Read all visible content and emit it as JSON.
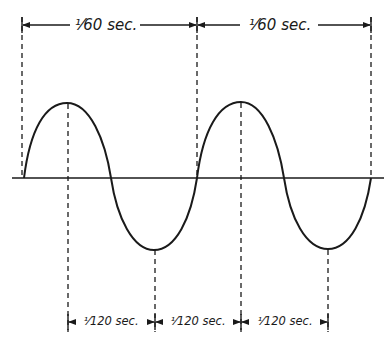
{
  "diagram": {
    "colors": {
      "ink": "#1a1a1a",
      "background": "#ffffff"
    },
    "top_labels": [
      {
        "text": "1/60 sec.",
        "x1": 22,
        "x2": 197
      },
      {
        "text": "1/60 sec.",
        "x1": 197,
        "x2": 371
      }
    ],
    "bottom_labels": [
      {
        "text": "1/120 sec.",
        "x1": 69,
        "x2": 156
      },
      {
        "text": "1/120 sec.",
        "x1": 156,
        "x2": 242
      },
      {
        "text": "1/120 sec.",
        "x1": 242,
        "x2": 329
      }
    ],
    "waveform": {
      "type": "sine",
      "cycles": 2,
      "baseline_y": 178,
      "zero_crossings_x": [
        24,
        111,
        197,
        284,
        371
      ],
      "peaks": [
        {
          "x": 67,
          "y": 103
        },
        {
          "x": 241,
          "y": 102
        }
      ],
      "troughs": [
        {
          "x": 154,
          "y": 250
        },
        {
          "x": 328,
          "y": 249
        }
      ]
    },
    "top_display": [
      "¹⁄60 sec.",
      "¹⁄60 sec."
    ],
    "bottom_display": [
      "¹⁄120 sec.",
      "¹⁄120 sec.",
      "¹⁄120 sec."
    ]
  }
}
